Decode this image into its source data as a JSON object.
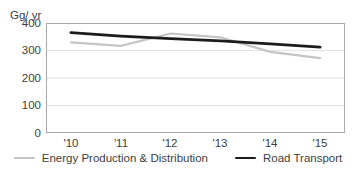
{
  "chart_data": {
    "type": "line",
    "title": "",
    "xlabel": "",
    "ylabel": "Gg/ yr",
    "categories": [
      "'10",
      "'11",
      "'12",
      "'13",
      "'14",
      "'15"
    ],
    "series": [
      {
        "name": "Energy Production & Distribution",
        "values": [
          330,
          317,
          362,
          348,
          295,
          272
        ],
        "color": "#c4c4c4",
        "stroke_width": 2.2
      },
      {
        "name": "Road Transport",
        "values": [
          365,
          352,
          343,
          335,
          324,
          312
        ],
        "color": "#1c1c1c",
        "stroke_width": 2.8
      }
    ],
    "ylim": [
      0,
      400
    ],
    "yticks": [
      "400",
      "300",
      "200",
      "100",
      "0"
    ],
    "grid_values": [
      300,
      200,
      100
    ],
    "grid": "on",
    "legend_position": "bottom",
    "colors": {
      "grid": "#e1e1e1",
      "frame": "#a8a8a8",
      "text": "#3d3d3d"
    }
  }
}
